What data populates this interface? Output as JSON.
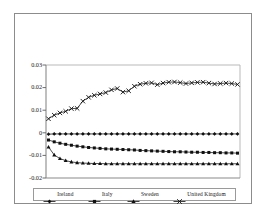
{
  "figure": {
    "title": "",
    "background": "#ffffff",
    "frame_color": "#8c8c8c"
  },
  "axis": {
    "y_ticks": [
      "0.03",
      "0.02",
      "0.01",
      "0",
      "-0.01",
      "-0.02"
    ],
    "y_tick_values": [
      0.03,
      0.02,
      0.01,
      0,
      -0.01,
      -0.02
    ],
    "x_tick_labels": []
  },
  "legend": {
    "items": [
      {
        "label": "Ireland",
        "marker": "diamond",
        "color": "#111111"
      },
      {
        "label": "Italy",
        "marker": "square",
        "color": "#111111"
      },
      {
        "label": "Sweden",
        "marker": "triangle",
        "color": "#111111"
      },
      {
        "label": "United Kingdom",
        "marker": "cross",
        "color": "#111111"
      }
    ]
  },
  "chart_data": {
    "type": "line",
    "title": "",
    "xlabel": "",
    "ylabel": "",
    "ylim": [
      -0.02,
      0.03
    ],
    "grid": false,
    "legend_position": "bottom",
    "x": [
      1,
      2,
      3,
      4,
      5,
      6,
      7,
      8,
      9,
      10,
      11,
      12,
      13,
      14,
      15,
      16,
      17,
      18,
      19,
      20,
      21,
      22,
      23,
      24,
      25,
      26,
      27,
      28,
      29,
      30,
      31,
      32,
      33,
      34
    ],
    "series": [
      {
        "name": "Ireland",
        "marker": "diamond",
        "color": "#111111",
        "values": [
          -0.0006,
          -0.0005,
          -0.0005,
          -0.0005,
          -0.0005,
          -0.0005,
          -0.0005,
          -0.0005,
          -0.0005,
          -0.0005,
          -0.0005,
          -0.0005,
          -0.0005,
          -0.0005,
          -0.0005,
          -0.0005,
          -0.0005,
          -0.0005,
          -0.0005,
          -0.0005,
          -0.0005,
          -0.0005,
          -0.0005,
          -0.0005,
          -0.0005,
          -0.0005,
          -0.0005,
          -0.0005,
          -0.0005,
          -0.0005,
          -0.0005,
          -0.0005,
          -0.0005,
          -0.0005
        ]
      },
      {
        "name": "Italy",
        "marker": "square",
        "color": "#111111",
        "values": [
          -0.0032,
          -0.004,
          -0.0046,
          -0.0051,
          -0.0055,
          -0.0059,
          -0.0062,
          -0.0065,
          -0.0067,
          -0.0069,
          -0.0071,
          -0.0072,
          -0.0073,
          -0.0074,
          -0.0075,
          -0.0076,
          -0.0078,
          -0.0079,
          -0.008,
          -0.0081,
          -0.0082,
          -0.0083,
          -0.0084,
          -0.0084,
          -0.0085,
          -0.0086,
          -0.0086,
          -0.0087,
          -0.0087,
          -0.0088,
          -0.0088,
          -0.0089,
          -0.0089,
          -0.009
        ]
      },
      {
        "name": "Sweden",
        "marker": "triangle",
        "color": "#111111",
        "values": [
          -0.0063,
          -0.0098,
          -0.0114,
          -0.0123,
          -0.0129,
          -0.0132,
          -0.0134,
          -0.0135,
          -0.0136,
          -0.0136,
          -0.0137,
          -0.0137,
          -0.0137,
          -0.0137,
          -0.0137,
          -0.0137,
          -0.0137,
          -0.0137,
          -0.0137,
          -0.0137,
          -0.0137,
          -0.0137,
          -0.0137,
          -0.0137,
          -0.0137,
          -0.0137,
          -0.0137,
          -0.0137,
          -0.0137,
          -0.0137,
          -0.0137,
          -0.0137,
          -0.0137,
          -0.0137
        ]
      },
      {
        "name": "United Kingdom",
        "marker": "cross",
        "color": "#111111",
        "values": [
          0.0062,
          0.0078,
          0.0088,
          0.0095,
          0.0107,
          0.0108,
          0.014,
          0.0157,
          0.0166,
          0.0172,
          0.0178,
          0.019,
          0.0196,
          0.018,
          0.0186,
          0.0206,
          0.0215,
          0.0219,
          0.0221,
          0.0213,
          0.022,
          0.0224,
          0.0225,
          0.0222,
          0.0218,
          0.0221,
          0.0223,
          0.0224,
          0.022,
          0.0216,
          0.0218,
          0.022,
          0.0218,
          0.0214
        ]
      }
    ]
  }
}
